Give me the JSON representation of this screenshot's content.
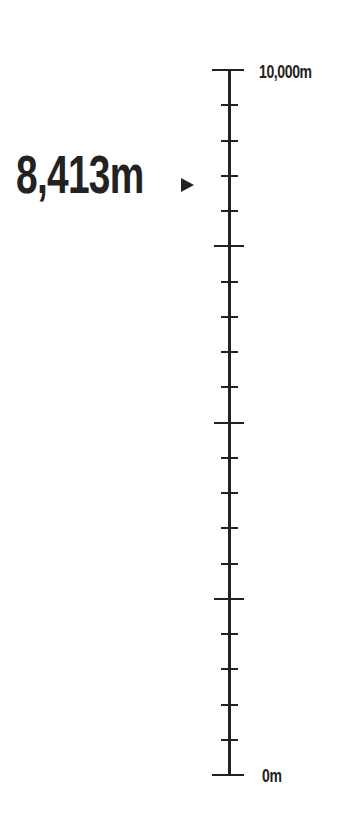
{
  "gauge": {
    "current_value_label": "8,413m",
    "current_value": 8413,
    "max_label": "10,000m",
    "min_label": "0m",
    "max": 10000,
    "min": 0,
    "major_tick_interval": 2500,
    "minor_tick_interval": 500,
    "marker_icon": "triangle-right-icon",
    "color": "#222222"
  }
}
